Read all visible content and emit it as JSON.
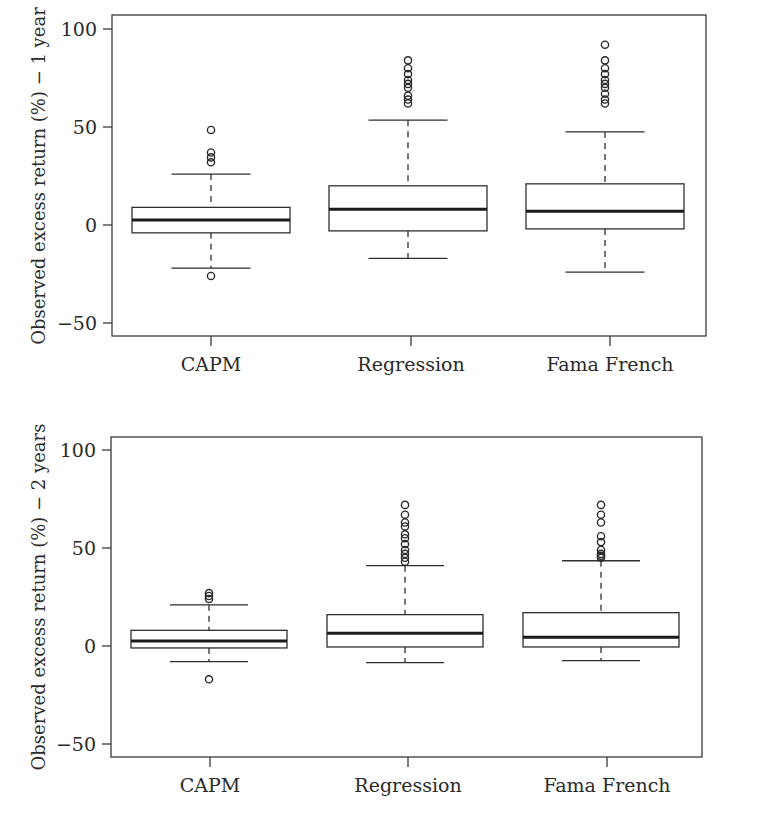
{
  "chart_data": [
    {
      "type": "box",
      "title": "",
      "xlabel": "",
      "ylabel": "Observed excess return (%) − 1 year",
      "ylim": [
        -56,
        106
      ],
      "yticks": [
        -50,
        0,
        50,
        100
      ],
      "ytick_labels": [
        "−50",
        "0",
        "50",
        "100"
      ],
      "grid": false,
      "legend": null,
      "categories": [
        "CAPM",
        "Regression",
        "Fama French"
      ],
      "series": [
        {
          "name": "CAPM",
          "whisker_low": -22,
          "q1": -4,
          "median": 2.5,
          "q3": 9,
          "whisker_high": 26,
          "outliers": [
            48.5,
            37,
            34.5,
            32,
            -26
          ]
        },
        {
          "name": "Regression",
          "whisker_low": -17,
          "q1": -3,
          "median": 8,
          "q3": 20,
          "whisker_high": 53.5,
          "outliers": [
            84,
            80,
            77,
            74,
            72,
            70,
            66,
            64,
            62
          ]
        },
        {
          "name": "Fama French",
          "whisker_low": -24,
          "q1": -2,
          "median": 7,
          "q3": 21,
          "whisker_high": 47.5,
          "outliers": [
            92,
            84,
            80,
            77,
            74,
            72,
            70,
            67,
            64,
            62
          ]
        }
      ]
    },
    {
      "type": "box",
      "title": "",
      "xlabel": "",
      "ylabel": "Observed excess return (%) − 2 years",
      "ylim": [
        -56,
        106
      ],
      "yticks": [
        -50,
        0,
        50,
        100
      ],
      "ytick_labels": [
        "−50",
        "0",
        "50",
        "100"
      ],
      "grid": false,
      "legend": null,
      "categories": [
        "CAPM",
        "Regression",
        "Fama French"
      ],
      "series": [
        {
          "name": "CAPM",
          "whisker_low": -8,
          "q1": -1,
          "median": 2.5,
          "q3": 8,
          "whisker_high": 21,
          "outliers": [
            27,
            25.5,
            24,
            -17
          ]
        },
        {
          "name": "Regression",
          "whisker_low": -8.5,
          "q1": -0.5,
          "median": 6.5,
          "q3": 16,
          "whisker_high": 41,
          "outliers": [
            72,
            67,
            63,
            61,
            57,
            55,
            52,
            49,
            47,
            45,
            43
          ]
        },
        {
          "name": "Fama French",
          "whisker_low": -7.5,
          "q1": -0.5,
          "median": 4.5,
          "q3": 17,
          "whisker_high": 43.5,
          "outliers": [
            72,
            67,
            63,
            56,
            53,
            49,
            47,
            46,
            45
          ]
        }
      ]
    }
  ],
  "panels": [
    {
      "ylabel": "Observed excess return (%) − 1 year",
      "ytick_labels": [
        "100",
        "50",
        "0",
        "−50"
      ],
      "xtick_labels": [
        "CAPM",
        "Regression",
        "Fama French"
      ]
    },
    {
      "ylabel": "Observed excess return (%) − 2 years",
      "ytick_labels": [
        "100",
        "50",
        "0",
        "−50"
      ],
      "xtick_labels": [
        "CAPM",
        "Regression",
        "Fama French"
      ]
    }
  ],
  "colors": {
    "ink": "#2a2a2a",
    "background": "#ffffff"
  }
}
